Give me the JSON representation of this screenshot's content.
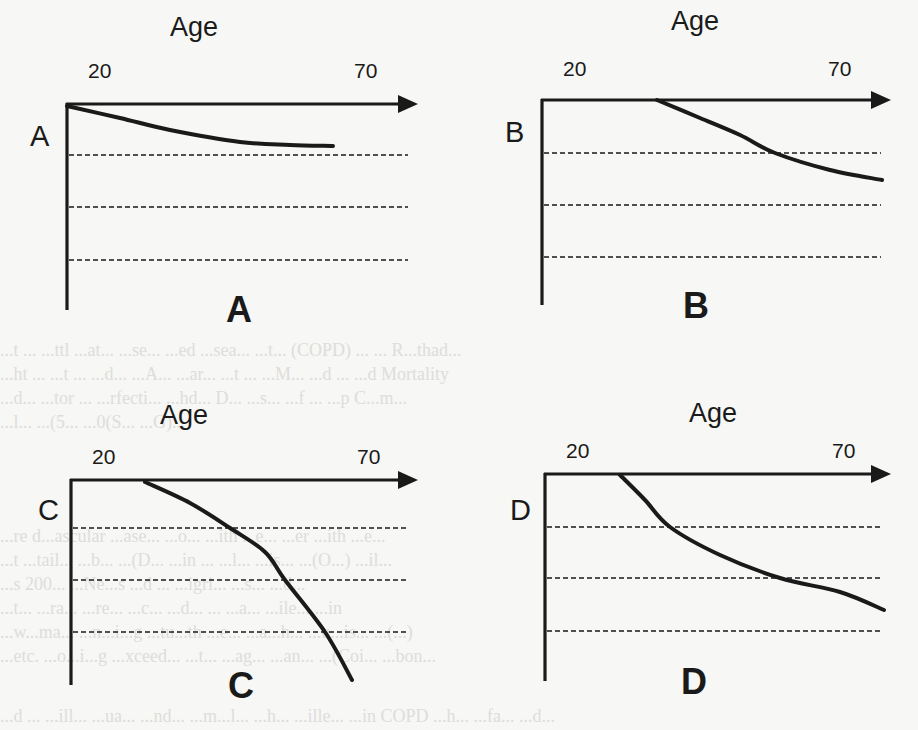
{
  "figure": {
    "type": "schematic-line-diagram",
    "colors": {
      "ink": "#1a1a1a",
      "paper": "#f7f7f5",
      "bleed_text": "#c9c9c6"
    },
    "panels": [
      {
        "id": "A",
        "axis_title": "Age",
        "tick_start": "20",
        "tick_end": "70",
        "side_label": "A",
        "caption": "A",
        "curve_shape": "gentle early decline that levels off",
        "origin": [
          67,
          104
        ],
        "arrow_tip": [
          418,
          104
        ],
        "y_bottom": 310,
        "dashed_y": [
          155,
          207,
          260
        ],
        "curve_points": [
          [
            67,
            106
          ],
          [
            120,
            118
          ],
          [
            170,
            130
          ],
          [
            240,
            142
          ],
          [
            290,
            145
          ],
          [
            333,
            146
          ]
        ],
        "title_pos": [
          170,
          14
        ],
        "tick_start_pos": [
          88,
          60
        ],
        "tick_end_pos": [
          354,
          60
        ],
        "side_pos": [
          30,
          122
        ],
        "caption_pos": [
          226,
          292
        ]
      },
      {
        "id": "B",
        "axis_title": "Age",
        "tick_start": "20",
        "tick_end": "70",
        "side_label": "B",
        "caption": "B",
        "curve_shape": "flat until mid-life, then steady decline",
        "origin": [
          542,
          100
        ],
        "arrow_tip": [
          891,
          100
        ],
        "y_bottom": 305,
        "dashed_y": [
          153,
          205,
          257
        ],
        "curve_points": [
          [
            657,
            100
          ],
          [
            700,
            118
          ],
          [
            740,
            135
          ],
          [
            775,
            153
          ],
          [
            830,
            170
          ],
          [
            882,
            180
          ]
        ],
        "title_pos": [
          671,
          8
        ],
        "tick_start_pos": [
          563,
          58
        ],
        "tick_end_pos": [
          828,
          58
        ],
        "side_pos": [
          505,
          118
        ],
        "caption_pos": [
          683,
          288
        ]
      },
      {
        "id": "C",
        "axis_title": "Age",
        "tick_start": "20",
        "tick_end": "70",
        "side_label": "C",
        "caption": "C",
        "curve_shape": "flat until mid-life, then accelerating decline",
        "origin": [
          71,
          480
        ],
        "arrow_tip": [
          418,
          480
        ],
        "y_bottom": 685,
        "dashed_y": [
          528,
          580,
          632
        ],
        "curve_points": [
          [
            145,
            482
          ],
          [
            190,
            503
          ],
          [
            230,
            528
          ],
          [
            265,
            552
          ],
          [
            285,
            580
          ],
          [
            325,
            632
          ],
          [
            352,
            680
          ]
        ],
        "title_pos": [
          160,
          402
        ],
        "tick_start_pos": [
          92,
          446
        ],
        "tick_end_pos": [
          357,
          446
        ],
        "side_pos": [
          38,
          496
        ],
        "caption_pos": [
          228,
          668
        ]
      },
      {
        "id": "D",
        "axis_title": "Age",
        "tick_start": "20",
        "tick_end": "70",
        "side_label": "D",
        "caption": "D",
        "curve_shape": "early steep decline, then slower continued decline",
        "origin": [
          545,
          474
        ],
        "arrow_tip": [
          891,
          474
        ],
        "y_bottom": 681,
        "dashed_y": [
          527,
          578,
          631
        ],
        "curve_points": [
          [
            620,
            475
          ],
          [
            645,
            500
          ],
          [
            670,
            527
          ],
          [
            720,
            555
          ],
          [
            780,
            578
          ],
          [
            840,
            592
          ],
          [
            884,
            610
          ]
        ],
        "title_pos": [
          689,
          400
        ],
        "tick_start_pos": [
          566,
          440
        ],
        "tick_end_pos": [
          832,
          440
        ],
        "side_pos": [
          510,
          496
        ],
        "caption_pos": [
          681,
          664
        ]
      }
    ]
  },
  "bleed_through_text": [
    {
      "top": 338,
      "text": "...t ... ...ttl ...at... ...se... ...ed ...sea... ...t... (COPD) ... ... R...thad..."
    },
    {
      "top": 362,
      "text": "...ht ... ...t ... ...d... ...A... ...ar... ...t ... ...M... ...d ... ...d Mortality"
    },
    {
      "top": 386,
      "text": "...d... ...tor ... ...rfecti... ...hd... D... ...s... ...f ... ...p C...m..."
    },
    {
      "top": 410,
      "text": "...l... ...(5... ...0(S... ...G)..."
    },
    {
      "top": 524,
      "text": "...re d...ascular ...ase... ...o... ...ith ...e... ...er ...ith ...e..."
    },
    {
      "top": 548,
      "text": "...t ...tail... ...b... ...(D... ...in ... ...l... ...is... ...(O...) ...il..."
    },
    {
      "top": 572,
      "text": "...s 200... ...Ne...s ...d ... ...igri... ...s... ...d..."
    },
    {
      "top": 596,
      "text": "...t... ...ra... ...re... ...c... ...d... ... ...a... ...ile... ...in"
    },
    {
      "top": 620,
      "text": "...w...ma... ...n...i...g ...tu...th ...e... ...a...h... ...u...is... ...(...)"
    },
    {
      "top": 644,
      "text": "...etc. ...o...i...g ...xceed... ...t... ...ag... ...an... ...(Coi... ...bon..."
    },
    {
      "top": 704,
      "text": "...d ... ...ill... ...ua... ...nd... ...m...l... ...h... ...ille... ...in COPD ...h... ...fa... ...d..."
    }
  ]
}
